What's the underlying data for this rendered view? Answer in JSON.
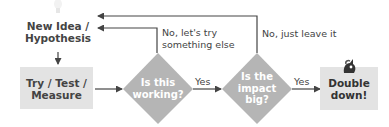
{
  "nodes": {
    "start": {
      "label_line1": "New Idea /",
      "label_line2": "Hypothesis",
      "icon": "lightbulb-icon"
    },
    "process": {
      "label_line1": "Try / Test /",
      "label_line2": "Measure"
    },
    "decision1": {
      "label_line1": "Is this",
      "label_line2": "working?"
    },
    "decision2": {
      "label_line1": "Is the",
      "label_line2": "impact",
      "label_line3": "big?"
    },
    "end": {
      "label_line1": "Double",
      "label_line2": "down!",
      "icon": "unicorn-icon"
    }
  },
  "edges": {
    "decision1_yes": "Yes",
    "decision2_yes": "Yes",
    "decision1_no_line1": "No, let's try",
    "decision1_no_line2": "something else",
    "decision2_no": "No, just leave it"
  },
  "colors": {
    "box_fill": "#e3e3e3",
    "diamond_fill": "#b5b5b5",
    "line": "#444444",
    "text": "#444444"
  }
}
